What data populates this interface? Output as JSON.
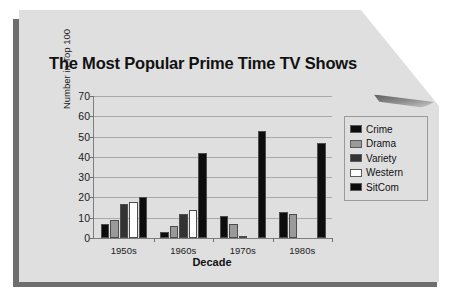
{
  "document": {
    "kind": "printed-chart-page",
    "paper_color": "#dfdfdf"
  },
  "chart_data": {
    "type": "bar",
    "title": "The Most Popular Prime Time TV Shows",
    "xlabel": "Decade",
    "ylabel": "Number in Top 100",
    "categories": [
      "1950s",
      "1960s",
      "1970s",
      "1980s"
    ],
    "yticks": [
      0,
      10,
      20,
      30,
      40,
      50,
      60,
      70
    ],
    "ylim": [
      0,
      70
    ],
    "grid": true,
    "legend_position": "right",
    "series": [
      {
        "name": "Crime",
        "color": "#0d0d0d",
        "values": [
          7,
          3,
          11,
          13
        ]
      },
      {
        "name": "Drama",
        "color": "#9a9a9a",
        "values": [
          9,
          6,
          7,
          12
        ]
      },
      {
        "name": "Variety",
        "color": "#333333",
        "values": [
          17,
          12,
          1,
          0
        ]
      },
      {
        "name": "Western",
        "color": "#ffffff",
        "values": [
          18,
          14,
          0,
          0
        ]
      },
      {
        "name": "SitCom",
        "color": "#0d0d0d",
        "values": [
          20,
          42,
          53,
          47
        ]
      }
    ]
  }
}
